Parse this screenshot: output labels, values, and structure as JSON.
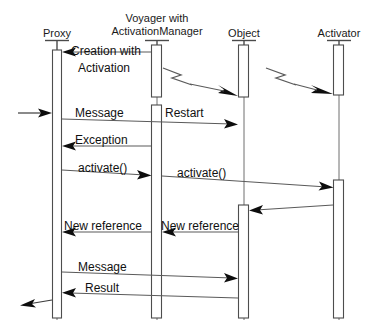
{
  "diagram": {
    "kind": "uml-sequence-diagram",
    "width": 371,
    "height": 333,
    "background_color": "#ffffff",
    "line_color": "#5a5a5a",
    "arrow_color": "#0d0d0d",
    "activation_fill": "#ffffff",
    "text_color": "#111111"
  },
  "lifelines": [
    {
      "id": "proxy",
      "label": "Proxy",
      "label_line2": "",
      "x": 57
    },
    {
      "id": "voyager",
      "label": "Voyager with",
      "label_line2": "ActivationManager",
      "x": 157
    },
    {
      "id": "object",
      "label": "Object",
      "label_line2": "",
      "x": 244
    },
    {
      "id": "activator",
      "label": "Activator",
      "label_line2": "",
      "x": 339
    }
  ],
  "messages": [
    {
      "id": "m1",
      "label": "Creation with",
      "label_line2": "Activation",
      "from": "voyager",
      "to": "proxy",
      "y": 52,
      "style": "solid"
    },
    {
      "id": "m2",
      "label": "",
      "from": "voyager",
      "to": "object",
      "y": 76,
      "style": "jagged"
    },
    {
      "id": "m3",
      "label": "",
      "from": "object",
      "to": "activator",
      "y": 76,
      "style": "jagged"
    },
    {
      "id": "m4",
      "label": "",
      "from": "external-left",
      "to": "proxy",
      "y": 113,
      "style": "solid"
    },
    {
      "id": "m5",
      "label": "Message",
      "from": "proxy",
      "to": "object",
      "y": 121,
      "style": "solid"
    },
    {
      "id": "m6",
      "label": "Restart",
      "from": "voyager",
      "to": "voyager",
      "y": 110,
      "style": "note"
    },
    {
      "id": "m7",
      "label": "Exception",
      "from": "voyager",
      "to": "proxy",
      "y": 146,
      "style": "solid"
    },
    {
      "id": "m8",
      "label": "activate()",
      "from": "proxy",
      "to": "voyager",
      "y": 174,
      "style": "solid"
    },
    {
      "id": "m9",
      "label": "activate()",
      "from": "voyager",
      "to": "activator",
      "y": 178,
      "style": "solid"
    },
    {
      "id": "m10",
      "label": "",
      "from": "activator",
      "to": "object",
      "y": 208,
      "style": "solid"
    },
    {
      "id": "m11",
      "label": "New reference",
      "from": "object",
      "to": "voyager",
      "y": 232,
      "style": "solid"
    },
    {
      "id": "m12",
      "label": "New reference",
      "from": "voyager",
      "to": "proxy",
      "y": 232,
      "style": "solid"
    },
    {
      "id": "m13",
      "label": "Message",
      "from": "proxy",
      "to": "object",
      "y": 275,
      "style": "solid"
    },
    {
      "id": "m14",
      "label": "Result",
      "from": "object",
      "to": "proxy",
      "y": 295,
      "style": "solid"
    },
    {
      "id": "m15",
      "label": "",
      "from": "proxy",
      "to": "external-left",
      "y": 302,
      "style": "solid"
    }
  ],
  "labels": {
    "proxy_title": "Proxy",
    "voyager_title_line1": "Voyager with",
    "voyager_title_line2": "ActivationManager",
    "object_title": "Object",
    "activator_title": "Activator",
    "creation_line1": "Creation with",
    "creation_line2": "Activation",
    "restart": "Restart",
    "message_1": "Message",
    "exception": "Exception",
    "activate_left": "activate()",
    "activate_right": "activate()",
    "new_reference_left": "New reference",
    "new_reference_right": "New reference",
    "message_2": "Message",
    "result": "Result"
  },
  "activations": [
    {
      "lifeline": "proxy",
      "x": 53,
      "y": 50,
      "w": 9,
      "h": 268
    },
    {
      "lifeline": "voyager",
      "x": 152,
      "y": 45,
      "w": 10,
      "h": 52
    },
    {
      "lifeline": "voyager",
      "x": 152,
      "y": 105,
      "w": 10,
      "h": 213
    },
    {
      "lifeline": "object",
      "x": 239,
      "y": 45,
      "w": 10,
      "h": 52
    },
    {
      "lifeline": "object",
      "x": 239,
      "y": 205,
      "w": 10,
      "h": 113
    },
    {
      "lifeline": "activator",
      "x": 334,
      "y": 45,
      "w": 10,
      "h": 50
    },
    {
      "lifeline": "activator",
      "x": 334,
      "y": 180,
      "w": 10,
      "h": 138
    }
  ]
}
